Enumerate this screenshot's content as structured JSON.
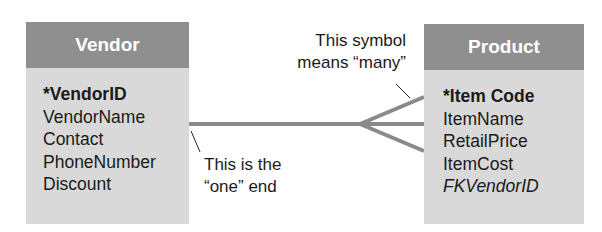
{
  "diagram": {
    "type": "entity-relationship",
    "entities": [
      {
        "name": "Vendor",
        "fields": [
          {
            "label": "*VendorID",
            "role": "primary-key"
          },
          {
            "label": "VendorName",
            "role": "attribute"
          },
          {
            "label": "Contact",
            "role": "attribute"
          },
          {
            "label": "PhoneNumber",
            "role": "attribute"
          },
          {
            "label": "Discount",
            "role": "attribute"
          }
        ]
      },
      {
        "name": "Product",
        "fields": [
          {
            "label": "*Item Code",
            "role": "primary-key"
          },
          {
            "label": "ItemName",
            "role": "attribute"
          },
          {
            "label": "RetailPrice",
            "role": "attribute"
          },
          {
            "label": "ItemCost",
            "role": "attribute"
          },
          {
            "label": "FKVendorID",
            "role": "foreign-key"
          }
        ]
      }
    ],
    "relationship": {
      "from": "Vendor",
      "to": "Product",
      "cardinality": "one-to-many"
    },
    "annotations": {
      "many_line1": "This symbol",
      "many_line2": "means “many”",
      "one_line1": "This is the",
      "one_line2": "“one” end"
    },
    "colors": {
      "header": "#8f8f8f",
      "body": "#d9d9d9",
      "connector": "#8a8a8a"
    }
  }
}
